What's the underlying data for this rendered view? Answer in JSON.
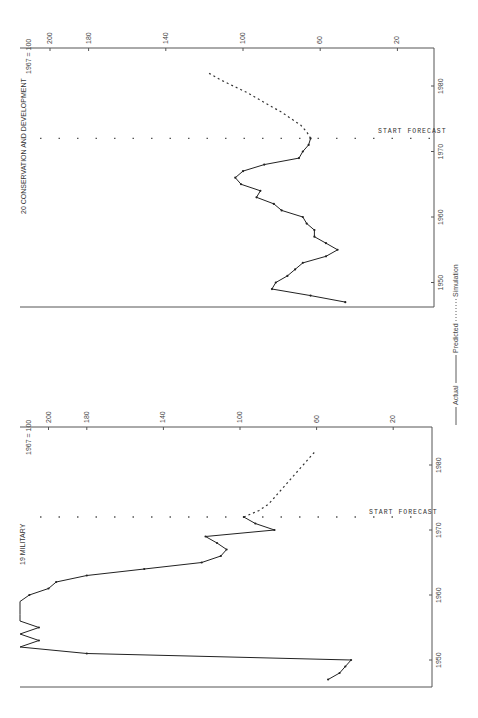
{
  "legend": {
    "actual": "Actual",
    "predicted": "Predicted",
    "simulation": "Simulation"
  },
  "chart_data": [
    {
      "type": "line",
      "title": "20 CONSERVATION AND DEVELOPMENT",
      "ylabel": "1967 = 100",
      "xlabel": "",
      "orientation": "rotated 90deg (years vertical, index horizontal)",
      "value_ticks": [
        200,
        180,
        140,
        100,
        60,
        20
      ],
      "year_ticks": [
        1950,
        1960,
        1970,
        1980
      ],
      "annotation": "START FORECAST",
      "forecast_start_year": 1972,
      "series": [
        {
          "name": "Actual",
          "x": [
            1947,
            1948,
            1949,
            1950,
            1951,
            1952,
            1953,
            1954,
            1955,
            1956,
            1957,
            1958,
            1959,
            1960,
            1961,
            1962,
            1963,
            1964,
            1965,
            1966,
            1967,
            1968,
            1969,
            1970,
            1971,
            1972
          ],
          "values": [
            47,
            65,
            85,
            83,
            77,
            73,
            69,
            57,
            51,
            57,
            63,
            63,
            67,
            69,
            80,
            84,
            93,
            91,
            101,
            104,
            100,
            89,
            71,
            69,
            66,
            65
          ]
        },
        {
          "name": "Simulation",
          "x": [
            1972,
            1973,
            1974,
            1975,
            1976,
            1977,
            1978,
            1979,
            1980,
            1981,
            1982
          ],
          "values": [
            65,
            67,
            70,
            75,
            80,
            86,
            92,
            98,
            105,
            112,
            118
          ]
        }
      ]
    },
    {
      "type": "line",
      "title": "19 MILITARY",
      "ylabel": "1967 = 100",
      "xlabel": "",
      "orientation": "rotated 90deg (years vertical, index horizontal)",
      "value_ticks": [
        200,
        180,
        140,
        100,
        60,
        20
      ],
      "year_ticks": [
        1950,
        1960,
        1970,
        1980
      ],
      "annotation": "START FORECAST",
      "forecast_start_year": 1972,
      "series": [
        {
          "name": "Actual",
          "x": [
            1947,
            1948,
            1949,
            1950,
            1951,
            1952,
            1953,
            1954,
            1955,
            1956,
            1957,
            1958,
            1959,
            1960,
            1961,
            1962,
            1963,
            1964,
            1965,
            1966,
            1967,
            1968,
            1969,
            1970,
            1971,
            1972
          ],
          "values": [
            54,
            48,
            45,
            42,
            180,
            240,
            205,
            250,
            205,
            240,
            230,
            225,
            220,
            210,
            200,
            196,
            180,
            150,
            120,
            110,
            107,
            112,
            118,
            82,
            92,
            98
          ],
          "note": "Values above 200 are off-scale (clipped at left edge)"
        },
        {
          "name": "Simulation",
          "x": [
            1972,
            1973,
            1974,
            1975,
            1976,
            1977,
            1978,
            1979,
            1980,
            1981,
            1982
          ],
          "values": [
            98,
            90,
            85,
            82,
            79,
            76,
            73,
            70,
            67,
            64,
            61
          ]
        }
      ]
    }
  ],
  "charts": {
    "top": {
      "title": "20 CONSERVATION AND DEVELOPMENT",
      "index_label": "1967 = 100",
      "forecast_label": "START FORECAST",
      "value_tick_labels": [
        "200",
        "180",
        "140",
        "100",
        "60",
        "20"
      ],
      "year_tick_labels": [
        "1950",
        "1960",
        "1970",
        "1980"
      ]
    },
    "bottom": {
      "title": "19 MILITARY",
      "index_label": "1967 = 100",
      "forecast_label": "START FORECAST",
      "value_tick_labels": [
        "200",
        "180",
        "140",
        "100",
        "60",
        "20"
      ],
      "year_tick_labels": [
        "1950",
        "1960",
        "1970",
        "1980"
      ]
    }
  }
}
